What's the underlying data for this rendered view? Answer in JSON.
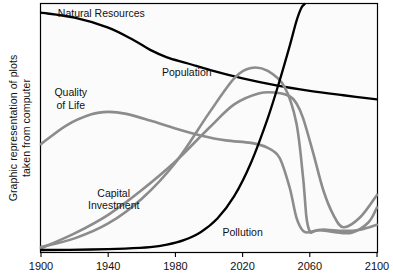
{
  "figure": {
    "y_axis_label_line1": "Graphic representation of plots",
    "y_axis_label_line2": "taken from computer",
    "background_color": "#ffffff",
    "plot_background_color": "#fbfbfb",
    "frame_color": "#000000"
  },
  "chart_data": {
    "type": "line",
    "title": "",
    "xlabel": "",
    "ylabel": "Graphic representation of plots taken from computer",
    "xlim": [
      1900,
      2100
    ],
    "ylim": [
      0,
      1
    ],
    "grid": false,
    "legend": "inline-annotations",
    "xticks": [
      "1900",
      "1940",
      "1980",
      "2020",
      "2060",
      "2100"
    ],
    "xtick_values": [
      1900,
      1940,
      1980,
      2020,
      2060,
      2100
    ],
    "yticks": [],
    "colors": {
      "black_series": "#000000",
      "gray_series": "#8c8c8c"
    },
    "series": [
      {
        "name": "Natural Resources",
        "color": "#000000",
        "label_x": 1910,
        "label_y": 0.96,
        "x": [
          1900,
          1920,
          1940,
          1955,
          1965,
          1975,
          1985,
          1990,
          2000,
          2020,
          2040,
          2060,
          2080,
          2100
        ],
        "values": [
          0.965,
          0.945,
          0.905,
          0.855,
          0.815,
          0.785,
          0.765,
          0.755,
          0.735,
          0.7,
          0.672,
          0.65,
          0.632,
          0.615
        ]
      },
      {
        "name": "Population",
        "color": "#8c8c8c",
        "label_x": 1972,
        "label_y": 0.72,
        "x": [
          1900,
          1920,
          1940,
          1960,
          1980,
          2000,
          2015,
          2025,
          2035,
          2045,
          2052,
          2056,
          2058,
          2060,
          2062,
          2066,
          2075,
          2085,
          2095,
          2100
        ],
        "values": [
          0.02,
          0.055,
          0.115,
          0.215,
          0.36,
          0.56,
          0.7,
          0.742,
          0.73,
          0.665,
          0.52,
          0.3,
          0.14,
          0.082,
          0.082,
          0.088,
          0.08,
          0.078,
          0.12,
          0.18
        ]
      },
      {
        "name": "Quality of Life",
        "color": "#8c8c8c",
        "label_x": 1908,
        "label_y": 0.64,
        "x": [
          1900,
          1915,
          1930,
          1940,
          1950,
          1965,
          1980,
          1995,
          2010,
          2025,
          2035,
          2042,
          2048,
          2052,
          2056,
          2060,
          2064,
          2070,
          2080,
          2090,
          2100
        ],
        "values": [
          0.435,
          0.51,
          0.555,
          0.565,
          0.558,
          0.53,
          0.498,
          0.47,
          0.45,
          0.44,
          0.42,
          0.38,
          0.26,
          0.14,
          0.085,
          0.08,
          0.088,
          0.09,
          0.085,
          0.09,
          0.11
        ]
      },
      {
        "name": "Capital Investment",
        "color": "#8c8c8c",
        "label_x": 1928,
        "label_y": 0.235,
        "x": [
          1900,
          1920,
          1940,
          1960,
          1980,
          2000,
          2015,
          2030,
          2040,
          2048,
          2052,
          2056,
          2062,
          2068,
          2074,
          2080,
          2090,
          2100
        ],
        "values": [
          0.015,
          0.075,
          0.15,
          0.25,
          0.365,
          0.5,
          0.595,
          0.64,
          0.642,
          0.628,
          0.6,
          0.54,
          0.4,
          0.25,
          0.15,
          0.1,
          0.14,
          0.23
        ]
      },
      {
        "name": "Pollution",
        "color": "#000000",
        "label_x": 2008,
        "label_y": 0.075,
        "x": [
          1900,
          1930,
          1950,
          1965,
          1975,
          1985,
          1995,
          2005,
          2015,
          2025,
          2035,
          2042,
          2048,
          2052,
          2055,
          2057
        ],
        "values": [
          0.008,
          0.01,
          0.014,
          0.02,
          0.03,
          0.048,
          0.08,
          0.135,
          0.225,
          0.36,
          0.54,
          0.69,
          0.83,
          0.93,
          0.985,
          1.0
        ]
      }
    ],
    "annotations": [
      {
        "text": "Natural Resources",
        "series": "Natural Resources"
      },
      {
        "text": "Population",
        "series": "Population"
      },
      {
        "text": "Quality of Life",
        "series": "Quality of Life",
        "lines": [
          "Quality",
          "of Life"
        ]
      },
      {
        "text": "Capital Investment",
        "series": "Capital Investment",
        "lines": [
          "Capital",
          "Investment"
        ]
      },
      {
        "text": "Pollution",
        "series": "Pollution"
      }
    ]
  }
}
